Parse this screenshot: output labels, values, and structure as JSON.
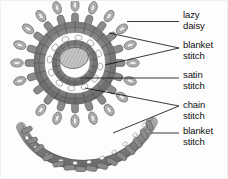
{
  "figure": {
    "type": "line-art illustration",
    "background_color": "#fdfdfd",
    "ink_color": "#3a3a3a",
    "objects": [
      {
        "name": "circular-floral-motif",
        "description": "round embroidered flower motif with radiating spokes, petal ring and hatched centre"
      },
      {
        "name": "curved-band-motif",
        "description": "crescent shaped embroidered band with looped chain core and edge spokes"
      }
    ]
  },
  "labels": [
    {
      "id": "lazy-daisy",
      "line1": "lazy",
      "line2": "daisy",
      "x": 182,
      "y": 9,
      "leader": "single"
    },
    {
      "id": "blanket-stitch-1",
      "line1": "blanket",
      "line2": "stitch",
      "x": 182,
      "y": 39,
      "leader": "double"
    },
    {
      "id": "satin-stitch",
      "line1": "satin",
      "line2": "stitch",
      "x": 182,
      "y": 69,
      "leader": "single"
    },
    {
      "id": "chain-stitch",
      "line1": "chain",
      "line2": "stitch",
      "x": 182,
      "y": 99,
      "leader": "double"
    },
    {
      "id": "blanket-stitch-2",
      "line1": "blanket",
      "line2": "stitch",
      "x": 182,
      "y": 125,
      "leader": "single"
    }
  ],
  "colors": {
    "text": "#111111",
    "leader_line": "#1a1a1a",
    "stitch_dark": "#6d6d6d",
    "stitch_mid": "#9a9a9a",
    "stitch_light": "#c9c9c9",
    "paper": "#fdfdfd"
  }
}
